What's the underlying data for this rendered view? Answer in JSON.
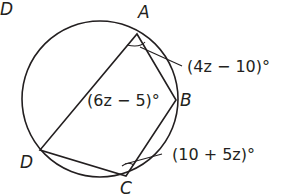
{
  "diagram": {
    "type": "inscribed quadrilateral in circle",
    "corner_label": "D",
    "vertices": {
      "A": {
        "label": "A"
      },
      "B": {
        "label": "B"
      },
      "C": {
        "label": "C"
      },
      "D": {
        "label": "D"
      }
    },
    "angles": {
      "A": {
        "expr": "(4z − 10)°"
      },
      "B": {
        "expr": "(6z − 5)°"
      },
      "C": {
        "expr": "(10 + 5z)°"
      }
    },
    "colors": {
      "stroke": "#231f20",
      "background": "#ffffff"
    }
  }
}
